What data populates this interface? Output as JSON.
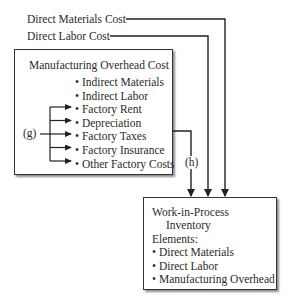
{
  "inputs": {
    "direct_materials": "Direct Materials Cost",
    "direct_labor": "Direct Labor Cost"
  },
  "overhead_box": {
    "title": "Manufacturing Overhead Cost",
    "items": [
      "Indirect Materials",
      "Indirect Labor",
      "Factory Rent",
      "Depreciation",
      "Factory Taxes",
      "Factory Insurance",
      "Other Factory Costs"
    ]
  },
  "labels": {
    "g": "(g)",
    "h": "(h)"
  },
  "wip_box": {
    "title_line1": "Work-in-Process",
    "title_line2": "Inventory",
    "elements_label": "Elements:",
    "elements": [
      "Direct Materials",
      "Direct Labor",
      "Manufacturing Overhead"
    ]
  }
}
